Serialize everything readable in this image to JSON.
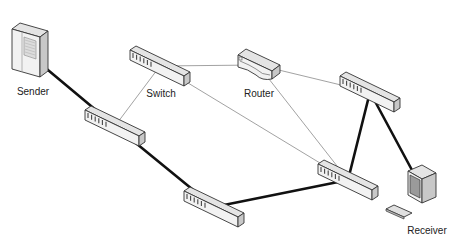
{
  "diagram": {
    "title": "",
    "colors": {
      "background": "#ffffff",
      "thick_link": "#111111",
      "thin_link": "#8a8a8a",
      "device_face": "#f2f2f2",
      "device_top": "#e4e4e4",
      "device_side": "#c8c8c8",
      "device_outline": "#333333"
    },
    "nodes": [
      {
        "id": "sender",
        "type": "server",
        "label": "Sender",
        "x": 30,
        "y": 55,
        "label_x": 33,
        "label_y": 86
      },
      {
        "id": "switch_main",
        "type": "switch",
        "label": "Switch",
        "x": 160,
        "y": 66,
        "label_x": 161,
        "label_y": 88
      },
      {
        "id": "router",
        "type": "router",
        "label": "Router",
        "x": 258,
        "y": 65,
        "label_x": 259,
        "label_y": 88
      },
      {
        "id": "switch_tr",
        "type": "switch",
        "label": "",
        "x": 370,
        "y": 92
      },
      {
        "id": "switch_l",
        "type": "switch",
        "label": "",
        "x": 115,
        "y": 126
      },
      {
        "id": "switch_b",
        "type": "switch",
        "label": "",
        "x": 214,
        "y": 207
      },
      {
        "id": "switch_r",
        "type": "switch",
        "label": "",
        "x": 348,
        "y": 180
      },
      {
        "id": "receiver",
        "type": "workstation",
        "label": "Receiver",
        "x": 420,
        "y": 185,
        "label_x": 427,
        "label_y": 225
      }
    ],
    "links": [
      {
        "from": "sender",
        "to": "switch_l",
        "weight": "thick"
      },
      {
        "from": "switch_l",
        "to": "switch_b",
        "weight": "thick"
      },
      {
        "from": "switch_b",
        "to": "switch_r",
        "weight": "thick"
      },
      {
        "from": "switch_r",
        "to": "switch_tr",
        "weight": "thick"
      },
      {
        "from": "switch_tr",
        "to": "receiver",
        "weight": "thick"
      },
      {
        "from": "switch_l",
        "to": "switch_main",
        "weight": "thin"
      },
      {
        "from": "switch_main",
        "to": "router",
        "weight": "thin"
      },
      {
        "from": "switch_main",
        "to": "switch_r",
        "weight": "thin"
      },
      {
        "from": "router",
        "to": "switch_tr",
        "weight": "thin"
      },
      {
        "from": "router",
        "to": "switch_r",
        "weight": "thin"
      }
    ]
  }
}
